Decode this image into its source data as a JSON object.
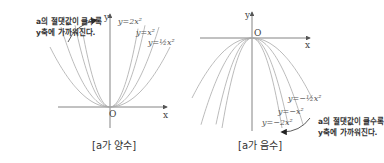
{
  "left_panel": {
    "caption": "[a가 양수]",
    "note_line1": "a의 절댓값이 클수록",
    "note_line2": "y축에 가까워진다.",
    "axis_x": "x",
    "axis_y": "y",
    "origin": "O",
    "curve_labels": [
      "y=2x²",
      "y=x²",
      "y=½x²"
    ],
    "coefficients": [
      2,
      1,
      0.5
    ]
  },
  "right_panel": {
    "caption": "[a가 음수]",
    "note_line1": "a의 절댓값이 클수록",
    "note_line2": "y축에 가까워진다.",
    "axis_x": "x",
    "axis_y": "y",
    "origin": "O",
    "curve_labels": [
      "y=−½x²",
      "y=−x²",
      "y=−2x²"
    ],
    "coefficients": [
      -0.5,
      -1,
      -2
    ]
  },
  "colors": {
    "curve": "#aaaaaa",
    "axis": "#555555",
    "text": "#333333"
  }
}
